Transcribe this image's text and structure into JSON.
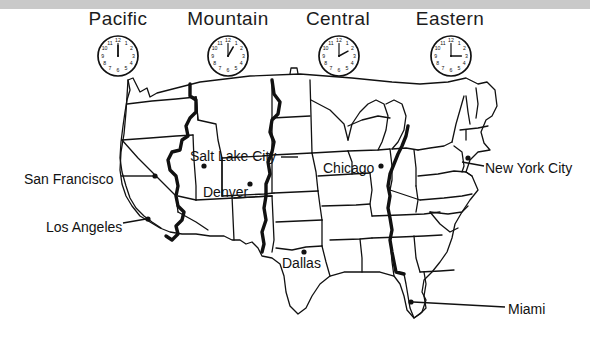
{
  "page": {
    "width": 590,
    "height": 343,
    "background_color": "#ffffff",
    "top_band_color": "#c9c9c9",
    "ink_color": "#111111"
  },
  "time_zones": [
    {
      "name": "Pacific",
      "clock_time": "12:00",
      "hour_hand_deg": 0,
      "minute_hand_deg": 0
    },
    {
      "name": "Mountain",
      "clock_time": "1:00",
      "hour_hand_deg": 30,
      "minute_hand_deg": 0
    },
    {
      "name": "Central",
      "clock_time": "2:00",
      "hour_hand_deg": 60,
      "minute_hand_deg": 0
    },
    {
      "name": "Eastern",
      "clock_time": "3:00",
      "hour_hand_deg": 90,
      "minute_hand_deg": 0
    }
  ],
  "clock_numerals": [
    "12",
    "1",
    "2",
    "3",
    "4",
    "5",
    "6",
    "7",
    "8",
    "9",
    "10",
    "11"
  ],
  "cities": [
    {
      "name": "San Francisco",
      "zone": "Pacific",
      "has_leader_line": true,
      "dot": true
    },
    {
      "name": "Los Angeles",
      "zone": "Pacific",
      "has_leader_line": true,
      "dot": true
    },
    {
      "name": "Salt Lake City",
      "zone": "Mountain",
      "has_leader_line": true,
      "dot": true
    },
    {
      "name": "Denver",
      "zone": "Mountain",
      "has_leader_line": false,
      "dot": true
    },
    {
      "name": "Chicago",
      "zone": "Central",
      "has_leader_line": false,
      "dot": true
    },
    {
      "name": "Dallas",
      "zone": "Central",
      "has_leader_line": false,
      "dot": true
    },
    {
      "name": "New York City",
      "zone": "Eastern",
      "has_leader_line": true,
      "dot": true
    },
    {
      "name": "Miami",
      "zone": "Eastern",
      "has_leader_line": true,
      "dot": true
    }
  ]
}
